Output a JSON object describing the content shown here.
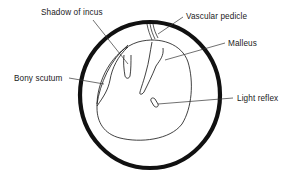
{
  "diagram": {
    "colors": {
      "stroke": "#111111",
      "background": "#ffffff",
      "text": "#1a1a1a"
    },
    "labels": [
      {
        "id": "shadow-of-incus",
        "text": "Shadow of incus"
      },
      {
        "id": "vascular-pedicle",
        "text": "Vascular pedicle"
      },
      {
        "id": "malleus",
        "text": "Malleus"
      },
      {
        "id": "bony-scutum",
        "text": "Bony scutum"
      },
      {
        "id": "light-reflex",
        "text": "Light reflex"
      }
    ]
  }
}
